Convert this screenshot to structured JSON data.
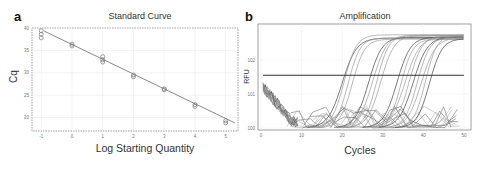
{
  "panels": {
    "a": {
      "label": "a",
      "title": "Standard Curve",
      "xlabel": "Log Starting Quantity",
      "ylabel": "Cq"
    },
    "b": {
      "label": "b",
      "title": "Amplification",
      "xlabel": "Cycles",
      "ylabel": "RFU"
    }
  },
  "chart_data": [
    {
      "type": "scatter",
      "title": "Standard Curve",
      "xlabel": "Log Starting Quantity",
      "ylabel": "Cq",
      "x_ticks": [
        "-1",
        "0",
        "1",
        "2",
        "3",
        "4",
        "5"
      ],
      "y_ticks": [
        "20",
        "25",
        "30",
        "35",
        "40"
      ],
      "xlim": [
        -1.3,
        5.4
      ],
      "ylim": [
        17,
        40
      ],
      "grid": true,
      "series": [
        {
          "name": "Replicates",
          "points": [
            {
              "x": -1,
              "y": 38.6
            },
            {
              "x": -1,
              "y": 37.8
            },
            {
              "x": -1,
              "y": 39.4
            },
            {
              "x": 0,
              "y": 36.4
            },
            {
              "x": 0,
              "y": 36.0
            },
            {
              "x": 1,
              "y": 33.6
            },
            {
              "x": 1,
              "y": 32.9
            },
            {
              "x": 1,
              "y": 32.4
            },
            {
              "x": 2,
              "y": 29.5
            },
            {
              "x": 2,
              "y": 29.1
            },
            {
              "x": 3,
              "y": 26.4
            },
            {
              "x": 3,
              "y": 26.2
            },
            {
              "x": 4,
              "y": 22.9
            },
            {
              "x": 4,
              "y": 22.5
            },
            {
              "x": 5,
              "y": 19.3
            },
            {
              "x": 5,
              "y": 18.8
            }
          ]
        },
        {
          "name": "Fit line",
          "type": "line",
          "x": [
            -0.9,
            5.3
          ],
          "y": [
            39.3,
            18.8
          ]
        }
      ]
    },
    {
      "type": "line",
      "title": "Amplification",
      "xlabel": "Cycles",
      "ylabel": "RFU",
      "x_ticks": [
        "0",
        "10",
        "20",
        "30",
        "40",
        "50"
      ],
      "y_ticks": [
        "10^0",
        "10^1",
        "10^2"
      ],
      "xlim": [
        0,
        51
      ],
      "yscale": "log",
      "threshold": {
        "value_log": 1.55,
        "x_range": [
          0.5,
          50
        ]
      },
      "curve_groups_ct": [
        15.5,
        16,
        17,
        18,
        22,
        23,
        24,
        25,
        29,
        30,
        31,
        32,
        33,
        34,
        35,
        36,
        37
      ],
      "plateau_log": 2.75,
      "grid": true
    }
  ]
}
